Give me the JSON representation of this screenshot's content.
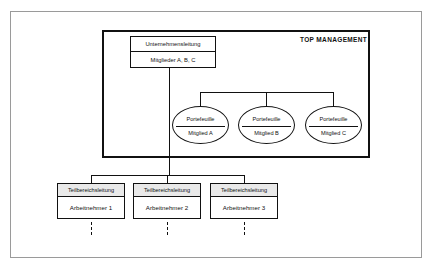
{
  "diagram": {
    "title_label": "TOP MANAGEMENT",
    "top_node": {
      "head": "Unternehmensleitung",
      "body": "Mitglieder A, B, C"
    },
    "portfolios": [
      {
        "head": "Portefeuille",
        "body": "Mitglied A"
      },
      {
        "head": "Portefeuille",
        "body": "Mitglied B"
      },
      {
        "head": "Portefeuille",
        "body": "Mitglied C"
      }
    ],
    "sub_units": [
      {
        "head": "Teilbereichsleitung",
        "body": "Arbeitnehmer 1"
      },
      {
        "head": "Teilbereichsleitung",
        "body": "Arbeitnehmer 2"
      },
      {
        "head": "Teilbereichsleitung",
        "body": "Arbeitnehmer 3"
      }
    ],
    "colors": {
      "line": "#111111",
      "frame": "#9a9a9a",
      "header_fill": "#e9e9e9",
      "node_fill": "#ffffff"
    }
  }
}
